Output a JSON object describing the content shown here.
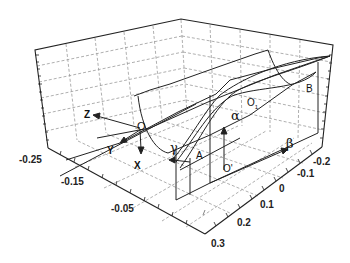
{
  "figure": {
    "type": "3d-surface-diagram",
    "tick_labels_left_axis": [
      "-0.25",
      "-0.15",
      "-0.05"
    ],
    "tick_labels_right_axis": [
      "-0.2",
      "-0.1",
      "0",
      "0.1",
      "0.2",
      "0.3"
    ],
    "frame_axes": {
      "local_frame": {
        "origin": "O",
        "axes": [
          "Z",
          "Y",
          "X"
        ]
      },
      "points": [
        "O1",
        "O'",
        "A",
        "B"
      ],
      "angles": [
        "α",
        "β",
        "γ"
      ]
    }
  },
  "labels": {
    "z": "Z",
    "y": "Y",
    "x": "X",
    "o": "O",
    "o1": "O",
    "o1_sub": "1",
    "o_prime": "O'",
    "a": "A",
    "b": "B",
    "alpha": "α",
    "beta": "β",
    "gamma": "γ"
  },
  "ticks": {
    "left": [
      "-0.25",
      "-0.15",
      "-0.05"
    ],
    "right": [
      "-0.2",
      "-0.1",
      "0",
      "0.1",
      "0.2",
      "0.3"
    ]
  },
  "colors": {
    "line": "#222222",
    "grid": "#9a9a9a",
    "background": "#ffffff"
  }
}
